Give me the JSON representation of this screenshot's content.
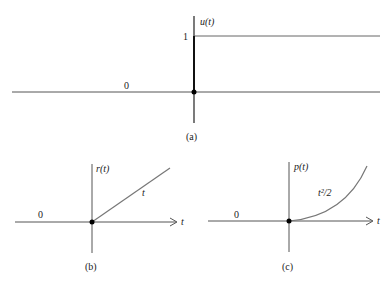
{
  "figure": {
    "panel_a": {
      "caption": "(a)",
      "y_label": "u(t)",
      "level_one_label": "1",
      "zero_label": "0",
      "description": "unit step"
    },
    "panel_b": {
      "caption": "(b)",
      "y_label": "r(t)",
      "curve_label": "t",
      "zero_label": "0",
      "x_label": "t",
      "description": "unit ramp"
    },
    "panel_c": {
      "caption": "(c)",
      "y_label": "p(t)",
      "curve_label": "t²/2",
      "zero_label": "0",
      "x_label": "t",
      "description": "unit parabola"
    }
  },
  "colors": {
    "axis": "#333333",
    "curve": "#666666",
    "dot": "#000000"
  }
}
